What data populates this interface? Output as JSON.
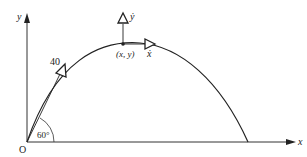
{
  "diagram": {
    "axes": {
      "x_label": "x",
      "y_label": "y",
      "origin_label": "O"
    },
    "launch": {
      "speed_label": "40",
      "angle_label": "60°"
    },
    "point": {
      "label": "(x, y)",
      "xdot_label": "ẋ",
      "ydot_label": "ẏ"
    },
    "colors": {
      "stroke": "#222222",
      "axis": "#333333"
    }
  }
}
